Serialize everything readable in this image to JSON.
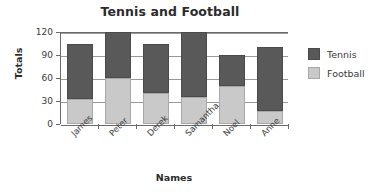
{
  "chart_data": {
    "type": "bar",
    "subtype": "stacked",
    "title": "Tennis and Football",
    "xlabel": "Names",
    "ylabel": "Totals",
    "categories": [
      "James",
      "Peter",
      "Derek",
      "Samantha",
      "Noel",
      "Anne"
    ],
    "series": [
      {
        "name": "Football",
        "color": "#c9c9c9",
        "values": [
          32,
          60,
          40,
          35,
          50,
          17
        ]
      },
      {
        "name": "Tennis",
        "color": "#595959",
        "values": [
          72,
          60,
          64,
          85,
          40,
          84
        ]
      }
    ],
    "totals": [
      104,
      120,
      104,
      120,
      90,
      101
    ],
    "ylim": [
      0,
      120
    ],
    "yticks": [
      0,
      30,
      60,
      90,
      120
    ],
    "ytick_labels": [
      "0",
      "30",
      "60",
      "90",
      "120"
    ],
    "grid": true,
    "legend_position": "right",
    "legend_entries": [
      {
        "label": "Tennis",
        "color": "#595959"
      },
      {
        "label": "Football",
        "color": "#c9c9c9"
      }
    ]
  }
}
